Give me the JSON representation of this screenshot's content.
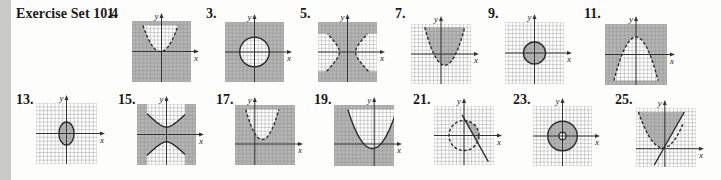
{
  "page": {
    "section_title": "Exercise Set 10.4",
    "edge_color": "#c9c9c7"
  },
  "colors": {
    "shade": "#b5b5b5",
    "grid_on_shade": "#9a9a9a",
    "grid_on_white": "#a8a8a8",
    "paper": "#ffffff",
    "axis": "#333333",
    "curve": "#2b2b2b"
  },
  "exercises": [
    {
      "id": "ex1",
      "label": "1.",
      "label_x": 107,
      "label_y": 6,
      "box": [
        132,
        21,
        59,
        61
      ],
      "origin": [
        0.5,
        0.5
      ],
      "axis_x": "x",
      "axis_y": "y",
      "type": "parabola-up-outside-shaded",
      "dashed": true
    },
    {
      "id": "ex3",
      "label": "3.",
      "label_x": 206,
      "label_y": 6,
      "box": [
        225,
        22,
        59,
        60
      ],
      "origin": [
        0.5,
        0.5
      ],
      "axis_x": "x",
      "axis_y": "y",
      "type": "circle-outside-shaded",
      "dashed": false
    },
    {
      "id": "ex5",
      "label": "5.",
      "label_x": 300,
      "label_y": 6,
      "box": [
        318,
        22,
        59,
        60
      ],
      "origin": [
        0.5,
        0.5
      ],
      "axis_x": "x",
      "axis_y": "y",
      "type": "hyperbola-horizontal-inside-shaded",
      "dashed": true
    },
    {
      "id": "ex7",
      "label": "7.",
      "label_x": 395,
      "label_y": 6,
      "box": [
        411,
        24,
        60,
        60
      ],
      "origin": [
        0.5,
        0.5
      ],
      "axis_x": "x",
      "axis_y": "y",
      "type": "parabola-up-shifted-inside-shaded",
      "dashed": true
    },
    {
      "id": "ex9",
      "label": "9.",
      "label_x": 488,
      "label_y": 6,
      "box": [
        505,
        22,
        59,
        62
      ],
      "origin": [
        0.5,
        0.5
      ],
      "axis_x": "x",
      "axis_y": "y",
      "type": "circle-inside-shaded",
      "dashed": false
    },
    {
      "id": "ex11",
      "label": "11.",
      "label_x": 584,
      "label_y": 6,
      "box": [
        605,
        24,
        62,
        61
      ],
      "origin": [
        0.5,
        0.5
      ],
      "axis_x": "x",
      "axis_y": "y",
      "type": "parabola-down-outside-shaded",
      "dashed": true
    },
    {
      "id": "ex13",
      "label": "13.",
      "label_x": 16,
      "label_y": 92,
      "box": [
        36,
        103,
        61,
        61
      ],
      "origin": [
        0.5,
        0.5
      ],
      "axis_x": "x",
      "axis_y": "y",
      "type": "ellipse-inside-shaded",
      "dashed": false
    },
    {
      "id": "ex15",
      "label": "15.",
      "label_x": 118,
      "label_y": 92,
      "box": [
        137,
        104,
        59,
        61
      ],
      "origin": [
        0.5,
        0.5
      ],
      "axis_x": "x",
      "axis_y": "y",
      "type": "hyperbola-vertical-outside-shaded",
      "dashed": false
    },
    {
      "id": "ex17",
      "label": "17.",
      "label_x": 216,
      "label_y": 92,
      "box": [
        235,
        105,
        60,
        60
      ],
      "origin": [
        0.33,
        0.65
      ],
      "axis_x": "x",
      "axis_y": "y",
      "type": "parabola-up-high-outside-shaded",
      "dashed": true
    },
    {
      "id": "ex19",
      "label": "19.",
      "label_x": 314,
      "label_y": 92,
      "box": [
        334,
        105,
        60,
        61
      ],
      "origin": [
        0.67,
        0.64
      ],
      "axis_x": "x",
      "axis_y": "y",
      "type": "parabola-up-low-outside-shaded",
      "dashed": false
    },
    {
      "id": "ex21",
      "label": "21.",
      "label_x": 413,
      "label_y": 92,
      "box": [
        434,
        106,
        60,
        59
      ],
      "origin": [
        0.5,
        0.5
      ],
      "axis_x": "x",
      "axis_y": "y",
      "type": "circle-line-segment-shaded",
      "dashed": true
    },
    {
      "id": "ex23",
      "label": "23.",
      "label_x": 513,
      "label_y": 92,
      "box": [
        533,
        106,
        59,
        60
      ],
      "origin": [
        0.5,
        0.5
      ],
      "axis_x": "x",
      "axis_y": "y",
      "type": "annulus-shaded",
      "dashed": false
    },
    {
      "id": "ex25",
      "label": "25.",
      "label_x": 615,
      "label_y": 92,
      "box": [
        636,
        108,
        60,
        59
      ],
      "origin": [
        0.48,
        0.69
      ],
      "axis_x": "x",
      "axis_y": "y",
      "type": "parabola-line-region-shaded",
      "dashed": true
    }
  ]
}
